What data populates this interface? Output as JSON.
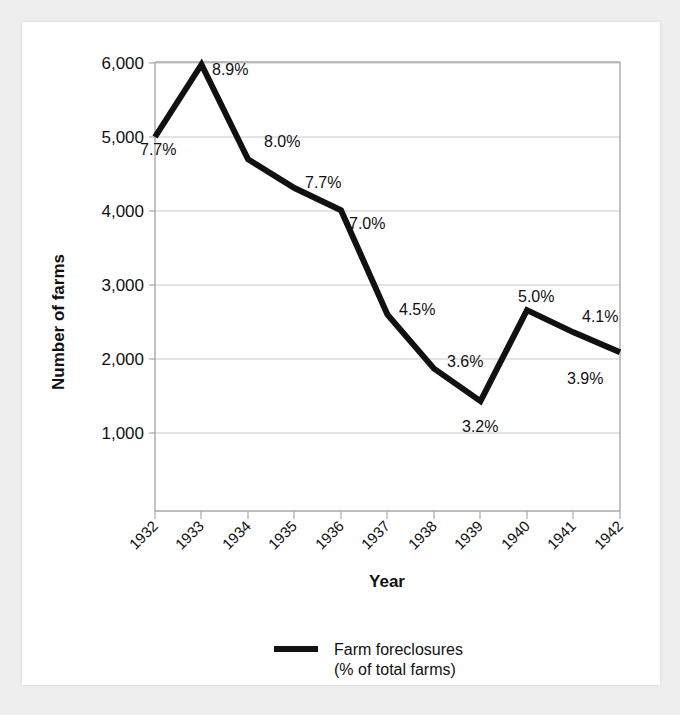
{
  "chart_data": {
    "type": "line",
    "title": "",
    "xlabel": "Year",
    "ylabel": "Number of farms",
    "categories": [
      "1932",
      "1933",
      "1934",
      "1935",
      "1936",
      "1937",
      "1938",
      "1939",
      "1940",
      "1941",
      "1942"
    ],
    "values": [
      5000,
      5980,
      4700,
      4310,
      4010,
      2600,
      1870,
      1430,
      2660,
      2360,
      2090
    ],
    "point_labels": [
      "7.7%",
      "8.9%",
      "8.0%",
      "7.7%",
      "7.0%",
      "4.5%",
      "3.6%",
      "3.2%",
      "5.0%",
      "4.1%",
      "3.9%"
    ],
    "series": [
      {
        "name": "Farm foreclosures (% of total farms)",
        "values": [
          5000,
          5980,
          4700,
          4310,
          4010,
          2600,
          1870,
          1430,
          2660,
          2360,
          2090
        ]
      }
    ],
    "yticks": [
      "1,000",
      "2,000",
      "3,000",
      "4,000",
      "5,000",
      "6,000"
    ],
    "ytick_values": [
      1000,
      2000,
      3000,
      4000,
      5000,
      6000
    ],
    "ylim": [
      440,
      6000
    ],
    "grid": true,
    "legend_position": "bottom-center",
    "line_color": "#111111",
    "grid_color": "#c9c9c9"
  },
  "legend": {
    "entries": [
      {
        "line1": "Farm foreclosures",
        "line2": "(% of total farms)"
      }
    ]
  },
  "axes": {
    "y_title": "Number of farms",
    "x_title": "Year"
  }
}
